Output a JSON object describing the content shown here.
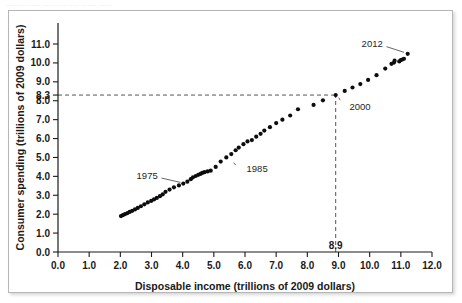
{
  "figure": {
    "top_bleed_text": "........ ....... .... .. ... ..... ....... ......",
    "frame_color": "#b6b6b6",
    "background": "#ffffff"
  },
  "chart_data": {
    "type": "scatter",
    "title": "",
    "xlabel": "Disposable income (trillions of 2009 dollars)",
    "ylabel": "Consumer spending (trillions of 2009 dollars)",
    "xlim": [
      0.0,
      12.0
    ],
    "ylim": [
      0.0,
      11.8
    ],
    "grid": false,
    "legend": null,
    "marker_color": "#0d0d0d",
    "xticks": [
      "0.0",
      "1.0",
      "2.0",
      "3.0",
      "4.0",
      "5.0",
      "6.0",
      "7.0",
      "8.0",
      "9.0",
      "10.0",
      "11.0",
      "12.0"
    ],
    "xtick_values": [
      0,
      1,
      2,
      3,
      4,
      5,
      6,
      7,
      8,
      9,
      10,
      11,
      12
    ],
    "yticks": [
      "0.0",
      "1.0",
      "2.0",
      "3.0",
      "4.0",
      "5.0",
      "6.0",
      "7.0",
      "8.0",
      "9.0",
      "10.0",
      "11.0"
    ],
    "ytick_values": [
      0,
      1,
      2,
      3,
      4,
      5,
      6,
      7,
      8,
      9,
      10,
      11
    ],
    "x": [
      2.02,
      2.08,
      2.15,
      2.23,
      2.3,
      2.38,
      2.47,
      2.56,
      2.66,
      2.77,
      2.88,
      2.99,
      3.08,
      3.17,
      3.27,
      3.36,
      3.45,
      3.58,
      3.72,
      3.88,
      4.02,
      4.15,
      4.26,
      4.33,
      4.42,
      4.5,
      4.57,
      4.63,
      4.7,
      4.8,
      4.9,
      5.06,
      5.22,
      5.4,
      5.56,
      5.7,
      5.8,
      5.95,
      6.08,
      6.22,
      6.36,
      6.5,
      6.62,
      6.8,
      7.0,
      7.2,
      7.45,
      7.7,
      8.2,
      8.5,
      8.91,
      9.2,
      9.45,
      9.7,
      9.95,
      10.22,
      10.5,
      10.7,
      10.78,
      10.8,
      10.95,
      11.0,
      11.05,
      11.1,
      11.22
    ],
    "y": [
      1.9,
      1.95,
      2.0,
      2.06,
      2.12,
      2.18,
      2.25,
      2.33,
      2.42,
      2.52,
      2.62,
      2.7,
      2.78,
      2.86,
      2.95,
      3.05,
      3.18,
      3.3,
      3.42,
      3.52,
      3.62,
      3.72,
      3.85,
      3.95,
      4.02,
      4.08,
      4.13,
      4.18,
      4.22,
      4.26,
      4.3,
      4.5,
      4.78,
      5.0,
      5.18,
      5.38,
      5.52,
      5.7,
      5.85,
      5.92,
      6.1,
      6.25,
      6.42,
      6.6,
      6.82,
      7.0,
      7.22,
      7.55,
      7.78,
      8.02,
      8.3,
      8.52,
      8.7,
      8.88,
      9.1,
      9.35,
      9.7,
      9.95,
      10.02,
      10.12,
      10.08,
      10.15,
      10.18,
      10.22,
      10.48
    ],
    "annotations": [
      {
        "label": "1975",
        "x": 4.05,
        "y": 3.62,
        "label_x": 3.2,
        "label_y": 4.05
      },
      {
        "label": "1985",
        "x": 5.52,
        "y": 4.82,
        "label_x": 6.05,
        "label_y": 4.4
      },
      {
        "label": "2000",
        "x": 8.91,
        "y": 8.3,
        "label_x": 9.35,
        "label_y": 7.7
      },
      {
        "label": "2012",
        "x": 11.22,
        "y": 10.48,
        "label_x": 10.42,
        "label_y": 11.02
      }
    ],
    "callouts": [
      {
        "axis": "y",
        "label": "8.3",
        "value": 8.3
      },
      {
        "axis": "x",
        "label": "8.9",
        "value": 8.91
      }
    ],
    "guides": [
      {
        "orientation": "horizontal",
        "value": 8.3,
        "from": 0.0,
        "to": 8.91,
        "style": "dashed"
      },
      {
        "orientation": "vertical",
        "value": 8.91,
        "from": 0.0,
        "to": 8.3,
        "style": "dashed"
      }
    ]
  }
}
